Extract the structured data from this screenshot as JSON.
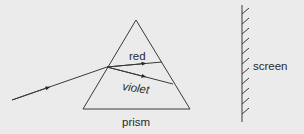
{
  "diagram": {
    "type": "physics-dispersion",
    "background": "#ebebeb",
    "line_color": "#3a3a3a",
    "labels": {
      "red": "red",
      "violet": "violet",
      "prism": "prism",
      "screen": "screen"
    },
    "prism": {
      "apex": [
        136,
        20
      ],
      "base_left": [
        83,
        109
      ],
      "base_right": [
        190,
        109
      ]
    },
    "rays": {
      "incident": {
        "from": [
          12,
          100
        ],
        "to": [
          107,
          67
        ]
      },
      "red": {
        "from": [
          107,
          67
        ],
        "to": [
          162,
          62
        ]
      },
      "violet": {
        "from": [
          107,
          67
        ],
        "to": [
          173,
          84
        ]
      }
    },
    "screen": {
      "x": 242,
      "y_top": 5,
      "y_bottom": 122,
      "hatch_count": 11
    }
  }
}
